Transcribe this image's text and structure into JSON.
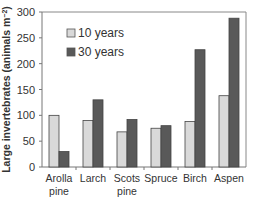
{
  "chart_data": {
    "type": "bar",
    "title": "",
    "xlabel": "",
    "ylabel": "Large invertebrates (animals m⁻²)",
    "ylim": [
      0,
      300
    ],
    "yticks": [
      0,
      50,
      100,
      150,
      200,
      250,
      300
    ],
    "grid": false,
    "legend_position": "upper-left-inside",
    "categories": [
      "Arolla pine",
      "Larch",
      "Scots pine",
      "Spruce",
      "Birch",
      "Aspen"
    ],
    "category_lines": [
      [
        "Arolla",
        "pine"
      ],
      [
        "Larch"
      ],
      [
        "Scots",
        "pine"
      ],
      [
        "Spruce"
      ],
      [
        "Birch"
      ],
      [
        "Aspen"
      ]
    ],
    "series": [
      {
        "name": "10 years",
        "color": "#d9d9d9",
        "values": [
          100,
          90,
          68,
          75,
          88,
          138
        ]
      },
      {
        "name": "30 years",
        "color": "#595959",
        "values": [
          30,
          130,
          92,
          80,
          227,
          288
        ]
      }
    ]
  }
}
